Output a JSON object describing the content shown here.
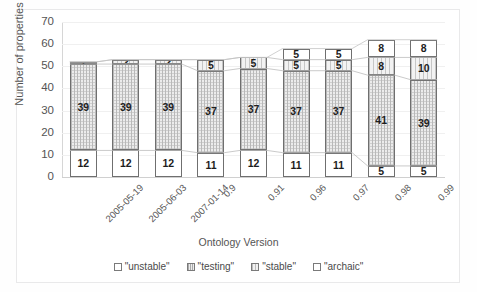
{
  "chart_data": {
    "type": "bar",
    "subtype": "stacked-bar",
    "title": "",
    "xlabel": "Ontology Version",
    "ylabel": "Number of properties",
    "ylim": [
      0,
      70
    ],
    "ytick_step": 10,
    "yticks": [
      0,
      10,
      20,
      30,
      40,
      50,
      60,
      70
    ],
    "grid": true,
    "legend_position": "bottom",
    "categories": [
      "2005-05-19",
      "2005-06-03",
      "2007-01-14",
      "0.9",
      "0.91",
      "0.96",
      "0.97",
      "0.98",
      "0.99"
    ],
    "series": [
      {
        "name": "\"unstable\"",
        "pattern": "solid-white",
        "values": [
          12,
          12,
          12,
          11,
          12,
          11,
          11,
          5,
          5
        ],
        "labels": [
          "12",
          "12",
          "12",
          "11",
          "12",
          "11",
          "11",
          "5",
          "5"
        ]
      },
      {
        "name": "\"testing\"",
        "pattern": "fine-dotted",
        "values": [
          39,
          39,
          39,
          37,
          37,
          37,
          37,
          41,
          39
        ],
        "labels": [
          "39",
          "39",
          "39",
          "37",
          "37",
          "37",
          "37",
          "41",
          "39"
        ]
      },
      {
        "name": "\"stable\"",
        "pattern": "vertical-hatch",
        "values": [
          1,
          2,
          2,
          5,
          5,
          5,
          5,
          8,
          10
        ],
        "labels": [
          "1",
          "2",
          "2",
          "5",
          "5",
          "5",
          "5",
          "8",
          "10"
        ]
      },
      {
        "name": "\"archaic\"",
        "pattern": "solid-white",
        "values": [
          0,
          0,
          0,
          0,
          0,
          5,
          5,
          8,
          8
        ],
        "labels": [
          "",
          "",
          "",
          "",
          "",
          "5",
          "5",
          "8",
          "8"
        ]
      }
    ],
    "totals": [
      52,
      53,
      53,
      53,
      54,
      58,
      58,
      62,
      62
    ],
    "colors": {
      "unstable": "#ffffff",
      "testing": "#ececec",
      "stable": "#f2f2f2",
      "archaic": "#ffffff",
      "border": "#6f6f6f",
      "axis": "#d0d0d0",
      "grid": "#f0f0f0",
      "text": "#545454"
    }
  },
  "legend": {
    "items": [
      {
        "label": "\"unstable\"",
        "key": "unstable"
      },
      {
        "label": "\"testing\"",
        "key": "testing"
      },
      {
        "label": "\"stable\"",
        "key": "stable"
      },
      {
        "label": "\"archaic\"",
        "key": "archaic"
      }
    ]
  }
}
